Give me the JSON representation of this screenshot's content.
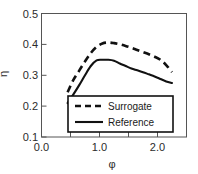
{
  "chart_data": {
    "type": "line",
    "title": "",
    "subtitle": "",
    "xlabel": "φ",
    "ylabel": "η",
    "xlim": [
      0.0,
      2.5
    ],
    "ylim": [
      0.1,
      0.5
    ],
    "grid": false,
    "legend_position": "inside-bottom-center",
    "x_ticks": [
      0.0,
      0.5,
      1.0,
      1.5,
      2.0,
      2.5
    ],
    "x_tick_labels": [
      "0.0",
      "",
      "1.0",
      "",
      "2.0",
      ""
    ],
    "y_ticks": [
      0.1,
      0.2,
      0.3,
      0.4,
      0.5
    ],
    "y_tick_labels": [
      "0.1",
      "0.2",
      "0.3",
      "0.4",
      "0.5"
    ],
    "series": [
      {
        "name": "Surrogate",
        "style": "dashed",
        "color": "#111111",
        "x": [
          0.45,
          0.55,
          0.65,
          0.75,
          0.85,
          0.95,
          1.05,
          1.15,
          1.25,
          1.35,
          1.45,
          1.55,
          1.65,
          1.75,
          1.85,
          1.95,
          2.05,
          2.15,
          2.25
        ],
        "y": [
          0.245,
          0.285,
          0.315,
          0.345,
          0.372,
          0.392,
          0.403,
          0.406,
          0.404,
          0.4,
          0.395,
          0.389,
          0.382,
          0.375,
          0.368,
          0.36,
          0.35,
          0.333,
          0.31
        ]
      },
      {
        "name": "Reference",
        "style": "solid",
        "color": "#111111",
        "x": [
          0.45,
          0.55,
          0.65,
          0.75,
          0.85,
          0.95,
          1.05,
          1.15,
          1.25,
          1.35,
          1.45,
          1.55,
          1.65,
          1.75,
          1.85,
          1.95,
          2.05,
          2.15,
          2.25
        ],
        "y": [
          0.21,
          0.238,
          0.268,
          0.3,
          0.33,
          0.348,
          0.35,
          0.35,
          0.347,
          0.338,
          0.33,
          0.322,
          0.316,
          0.31,
          0.303,
          0.296,
          0.288,
          0.28,
          0.275
        ]
      }
    ],
    "legend": [
      {
        "label": "Surrogate",
        "style": "dashed"
      },
      {
        "label": "Reference",
        "style": "solid"
      }
    ]
  }
}
